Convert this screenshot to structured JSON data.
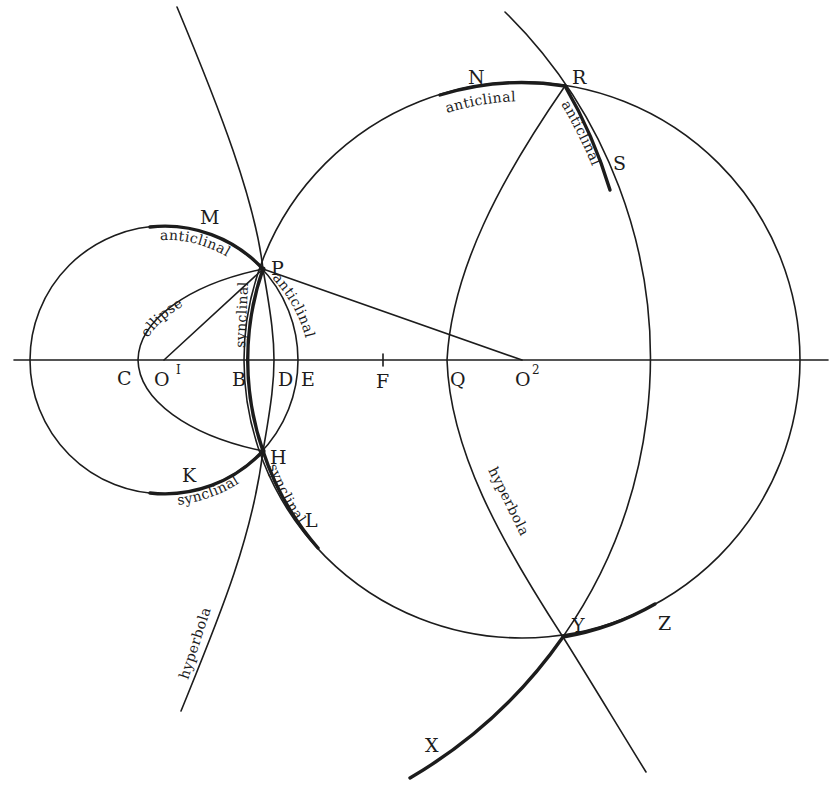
{
  "figure": {
    "points": {
      "P": "P",
      "H": "H",
      "M": "M",
      "K": "K",
      "L": "L",
      "N": "N",
      "R": "R",
      "S": "S",
      "Y": "Y",
      "Z": "Z",
      "X": "X",
      "C": "C",
      "O1": "O",
      "O1_sup": "I",
      "B": "B",
      "D": "D",
      "E": "E",
      "F": "F",
      "Q": "Q",
      "O2": "O",
      "O2_sup": "2"
    },
    "curve_labels": {
      "anticlinal_M": "anticlinal",
      "ellipse": "ellipse",
      "synclinal_B": "synclinal",
      "anticlinal_E": "anticlinal",
      "synclinal_K": "synclinal",
      "synclinal_L": "synclinal",
      "hyperbola_left": "hyperbola",
      "anticlinal_N": "anticlinal",
      "anticlinal_S": "anticlinal",
      "hyperbola_right": "hyperbola"
    },
    "colors": {
      "ink": "#1c1c1c",
      "paper": "#ffffff"
    }
  }
}
